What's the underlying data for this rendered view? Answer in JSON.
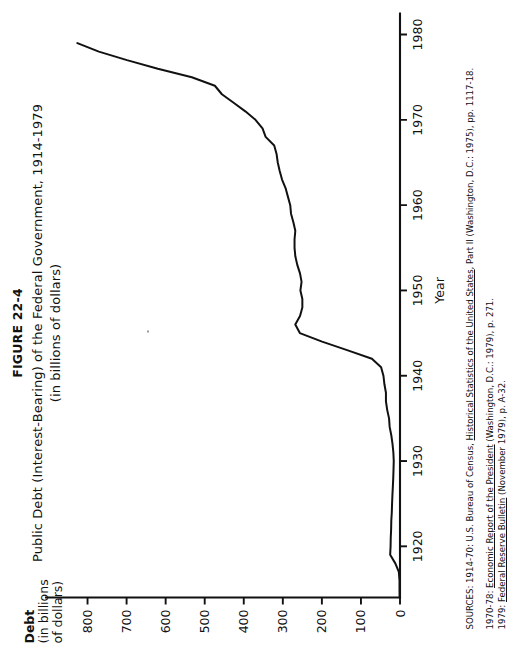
{
  "figure": {
    "number": "FIGURE 22-4",
    "title": "Public Debt (Interest-Bearing) of the Federal Government, 1914-1979",
    "subtitle": "(in billions of dollars)"
  },
  "sources": {
    "label": "SOURCES:",
    "line1_prefix": "SOURCES: 1914-70: U.S. Bureau of Census, ",
    "line1_italic": "Historical Statistics of the United States",
    "line1_suffix": ", Part II (Washington, D.C.: 1975), pp. 1117-18.",
    "line2_prefix": "1970-78: ",
    "line2_italic": "Economic Report of the President",
    "line2_suffix": " (Washington, D.C.: 1979), p. 271.",
    "line3_prefix": "1979: ",
    "line3_italic": "Federal Reserve Bulletin",
    "line3_suffix": " (November 1979), p. A-32."
  },
  "chart_data": {
    "type": "line",
    "title": "Public Debt (Interest-Bearing) of the Federal Government, 1914-1979",
    "xlabel": "Year",
    "ylabel": "Debt (in billions of dollars)",
    "ylabel_line1": "Debt",
    "ylabel_line2": "(in billions",
    "ylabel_line3": "of dollars)",
    "xlim": [
      1914,
      1982
    ],
    "ylim": [
      0,
      850
    ],
    "xticks": [
      1920,
      1930,
      1940,
      1950,
      1960,
      1970,
      1980
    ],
    "xticklabels": [
      "1920",
      "1930",
      "1940",
      "1950",
      "1960",
      "1970",
      "1980"
    ],
    "yticks": [
      0,
      100,
      200,
      300,
      400,
      500,
      600,
      700,
      800
    ],
    "yticklabels": [
      "0",
      "100",
      "200",
      "300",
      "400",
      "500",
      "600",
      "700",
      "800"
    ],
    "grid": false,
    "legend": false,
    "series": [
      {
        "name": "Public Debt (Interest-Bearing)",
        "x": [
          1914,
          1915,
          1916,
          1917,
          1918,
          1919,
          1920,
          1921,
          1922,
          1923,
          1924,
          1925,
          1926,
          1927,
          1928,
          1929,
          1930,
          1931,
          1932,
          1933,
          1934,
          1935,
          1936,
          1937,
          1938,
          1939,
          1940,
          1941,
          1942,
          1943,
          1944,
          1945,
          1946,
          1947,
          1948,
          1949,
          1950,
          1951,
          1952,
          1953,
          1954,
          1955,
          1956,
          1957,
          1958,
          1959,
          1960,
          1961,
          1962,
          1963,
          1964,
          1965,
          1966,
          1967,
          1968,
          1969,
          1970,
          1971,
          1972,
          1973,
          1974,
          1975,
          1976,
          1977,
          1978,
          1979
        ],
        "y": [
          1.0,
          1.2,
          1.2,
          3.0,
          12.0,
          25.2,
          24.1,
          23.7,
          22.7,
          22.3,
          21.0,
          20.3,
          19.4,
          18.3,
          17.3,
          16.6,
          16.0,
          17.0,
          19.2,
          22.2,
          26.5,
          28.0,
          32.8,
          36.0,
          36.0,
          39.9,
          42.4,
          48.4,
          71.9,
          135.4,
          199.5,
          256.4,
          268.1,
          256.0,
          250.0,
          250.0,
          255.0,
          252.0,
          256.0,
          263.0,
          268.0,
          270.0,
          270.0,
          268.0,
          273.0,
          279.0,
          281.0,
          287.0,
          293.0,
          302.0,
          308.0,
          313.0,
          316.0,
          322.0,
          344.0,
          352.0,
          370.0,
          396.0,
          426.0,
          456.0,
          474.0,
          533.0,
          620.0,
          699.0,
          771.0,
          826.0
        ]
      }
    ],
    "annotations": []
  }
}
